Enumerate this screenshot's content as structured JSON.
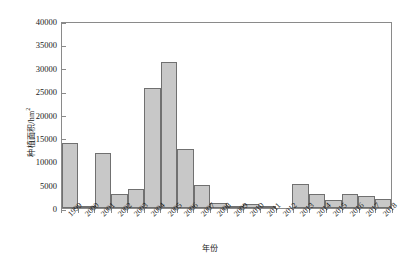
{
  "chart_data": {
    "type": "bar",
    "title": "",
    "xlabel": "年份",
    "ylabel": "种植面积/hm",
    "ylabel_sup": "2",
    "ylim": [
      0,
      40000
    ],
    "yticks": [
      0,
      5000,
      10000,
      15000,
      20000,
      25000,
      30000,
      35000,
      40000
    ],
    "ytick_labels": [
      "0",
      "5000",
      "10000",
      "15000",
      "20000",
      "25000",
      "30000",
      "35000",
      "40000"
    ],
    "grid": false,
    "legend": "none",
    "categories": [
      "1999",
      "2000",
      "2001",
      "2002",
      "2003",
      "2004",
      "2005",
      "2006",
      "2007",
      "2008",
      "2009",
      "2010",
      "2011",
      "2012",
      "2013",
      "2014",
      "2015",
      "2016",
      "2017",
      "2018"
    ],
    "values": [
      14000,
      500,
      11700,
      3000,
      4100,
      25700,
      31300,
      12600,
      5000,
      1100,
      200,
      900,
      200,
      0,
      5200,
      3000,
      1800,
      3000,
      2500,
      2000
    ],
    "bar_fill": "#c8c8c8",
    "bar_stroke": "#707070",
    "axis_color": "#8a8a8a"
  }
}
